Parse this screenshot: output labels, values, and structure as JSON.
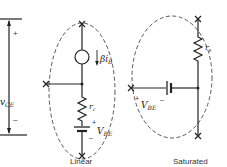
{
  "diagram": {
    "vce_scale": {
      "label_main": "v",
      "label_sub": "CE",
      "plus": "+",
      "minus": "–"
    },
    "linear": {
      "caption": "Linear",
      "current_source_label_main": "βi",
      "current_source_label_sub": "B",
      "resistor_label_main": "r",
      "resistor_label_sub": "c",
      "battery_label_main": "V",
      "battery_label_sub": "BE",
      "battery_plus": "+",
      "battery_minus": "–"
    },
    "saturated": {
      "caption": "Saturated",
      "resistor_label_main": "r",
      "resistor_label_sub": "s",
      "battery_label_main": "V",
      "battery_label_sub": "BE",
      "battery_plus": "+",
      "battery_minus": "–"
    }
  }
}
